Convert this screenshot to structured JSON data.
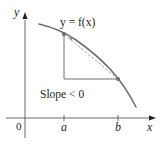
{
  "diagram": {
    "function_label": "y = f(x)",
    "slope_label": "Slope < 0",
    "axes": {
      "x_label": "x",
      "y_label": "y",
      "origin_label": "0",
      "ticks": [
        {
          "label": "a",
          "x": 64
        },
        {
          "label": "b",
          "x": 118
        }
      ]
    },
    "points": [
      {
        "name": "A",
        "x": 64,
        "y": 34
      },
      {
        "name": "B",
        "x": 118,
        "y": 79
      }
    ],
    "colors": {
      "curve": "#6d6e71",
      "axis": "#58595b",
      "triangle": "#6d6e71",
      "secant": "#8a8c8e",
      "point": "#6d6e71",
      "text": "#231f20"
    }
  }
}
